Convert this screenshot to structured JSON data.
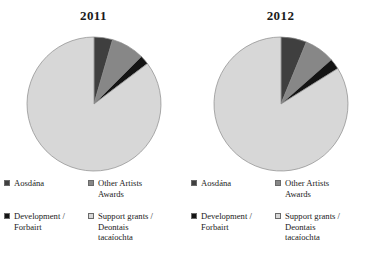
{
  "chart_data": [
    {
      "type": "pie",
      "title": "2011",
      "labels": [
        "Aosdána",
        "Other Artists Awards",
        "Development / Forbairt",
        "Support grants / Deontais tacaíochta"
      ],
      "values": [
        4.5,
        8.0,
        2.2,
        85.3
      ],
      "units": "percent",
      "start_angle": 0,
      "direction": "clockwise",
      "colors": [
        "#3f3f3f",
        "#878787",
        "#141414",
        "#d7d7d7"
      ],
      "legend_position": "below"
    },
    {
      "type": "pie",
      "title": "2012",
      "labels": [
        "Aosdána",
        "Other Artists Awards",
        "Development / Forbairt",
        "Support grants / Deontais tacaíochta"
      ],
      "values": [
        6.2,
        7.3,
        2.6,
        83.9
      ],
      "units": "percent",
      "start_angle": 0,
      "direction": "clockwise",
      "colors": [
        "#3f3f3f",
        "#878787",
        "#141414",
        "#d7d7d7"
      ],
      "legend_position": "below"
    }
  ],
  "panels": [
    {
      "title": "2011",
      "legend": [
        {
          "label": "Aosdána",
          "color": "#3f3f3f"
        },
        {
          "label": "Other Artists\nAwards",
          "color": "#878787"
        },
        {
          "label": "Development /\nForbairt",
          "color": "#141414"
        },
        {
          "label": "Support grants /\nDeontais\ntacaíochta",
          "color": "#d7d7d7"
        }
      ]
    },
    {
      "title": "2012",
      "legend": [
        {
          "label": "Aosdána",
          "color": "#3f3f3f"
        },
        {
          "label": "Other Artists\nAwards",
          "color": "#878787"
        },
        {
          "label": "Development /\nForbairt",
          "color": "#141414"
        },
        {
          "label": "Support grants /\nDeontais\ntacaíochta",
          "color": "#d7d7d7"
        }
      ]
    }
  ],
  "style": {
    "slice_outline": "#8a8a8a",
    "background": "#ffffff",
    "text_color": "#1a1a1a"
  }
}
